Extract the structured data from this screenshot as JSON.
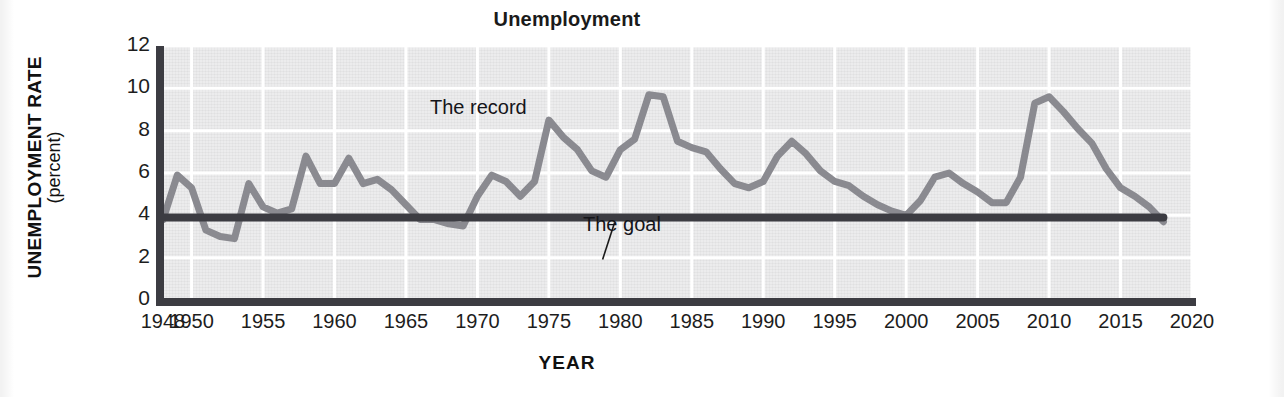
{
  "chart_data": {
    "type": "line",
    "title": "Unemployment",
    "xlabel": "YEAR",
    "ylabel": "UNEMPLOYMENT RATE",
    "ylabel_units": "(percent)",
    "xlim": [
      1948,
      2020
    ],
    "ylim": [
      0,
      12
    ],
    "grid": true,
    "legend": "none",
    "y_ticks": [
      "12",
      "10",
      "8",
      "6",
      "4",
      "2",
      "0"
    ],
    "y_tick_values": [
      12,
      10,
      8,
      6,
      4,
      2,
      0
    ],
    "x_ticks": [
      "1948",
      "1950",
      "1955",
      "1960",
      "1965",
      "1970",
      "1975",
      "1980",
      "1985",
      "1990",
      "1995",
      "2000",
      "2005",
      "2010",
      "2015",
      "2020"
    ],
    "x_tick_values": [
      1948,
      1950,
      1955,
      1960,
      1965,
      1970,
      1975,
      1980,
      1985,
      1990,
      1995,
      2000,
      2005,
      2010,
      2015,
      2020
    ],
    "annotations": [
      {
        "text": "The record",
        "x": 1973.0,
        "y": 8.6
      },
      {
        "text": "The goal",
        "x": 1979.2,
        "y": 2.45
      }
    ],
    "series": [
      {
        "name": "The record",
        "color": "#8a8a90",
        "x": [
          1948,
          1949,
          1950,
          1951,
          1952,
          1953,
          1954,
          1955,
          1956,
          1957,
          1958,
          1959,
          1960,
          1961,
          1962,
          1963,
          1964,
          1965,
          1966,
          1967,
          1968,
          1969,
          1970,
          1971,
          1972,
          1973,
          1974,
          1975,
          1976,
          1977,
          1978,
          1979,
          1980,
          1981,
          1982,
          1983,
          1984,
          1985,
          1986,
          1987,
          1988,
          1989,
          1990,
          1991,
          1992,
          1993,
          1994,
          1995,
          1996,
          1997,
          1998,
          1999,
          2000,
          2001,
          2002,
          2003,
          2004,
          2005,
          2006,
          2007,
          2008,
          2009,
          2010,
          2011,
          2012,
          2013,
          2014,
          2015,
          2016,
          2017,
          2018
        ],
        "values": [
          3.8,
          5.9,
          5.3,
          3.3,
          3.0,
          2.9,
          5.5,
          4.4,
          4.1,
          4.3,
          6.8,
          5.5,
          5.5,
          6.7,
          5.5,
          5.7,
          5.2,
          4.5,
          3.8,
          3.8,
          3.6,
          3.5,
          4.9,
          5.9,
          5.6,
          4.9,
          5.6,
          8.5,
          7.7,
          7.1,
          6.1,
          5.8,
          7.1,
          7.6,
          9.7,
          9.6,
          7.5,
          7.2,
          7.0,
          6.2,
          5.5,
          5.3,
          5.6,
          6.8,
          7.5,
          6.9,
          6.1,
          5.6,
          5.4,
          4.9,
          4.5,
          4.2,
          4.0,
          4.7,
          5.8,
          6.0,
          5.5,
          5.1,
          4.6,
          4.6,
          5.8,
          9.3,
          9.6,
          8.9,
          8.1,
          7.4,
          6.2,
          5.3,
          4.9,
          4.4,
          3.7
        ]
      },
      {
        "name": "The goal",
        "color": "#3c3c42",
        "constant_value": 3.9,
        "x_start": 1948,
        "x_end": 2018
      }
    ]
  },
  "title": {
    "text": "Unemployment"
  },
  "axes": {
    "y_title": "UNEMPLOYMENT RATE",
    "y_units": "(percent)",
    "x_title": "YEAR"
  },
  "annotations": {
    "record": "The record",
    "goal": "The goal"
  },
  "colors": {
    "record_line": "#8a8a90",
    "goal_line": "#3c3c42",
    "axis": "#3c3c42",
    "plot_background": "#ececed",
    "gridline": "#ffffff",
    "text": "#1d1d1d"
  }
}
